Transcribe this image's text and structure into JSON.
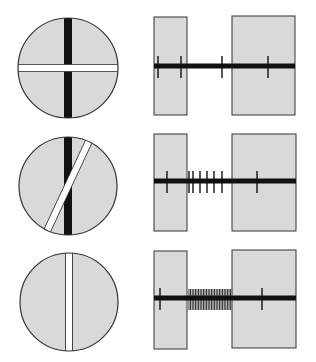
{
  "figure": {
    "colors": {
      "background": "#ffffff",
      "field_fill": "#d9d9d9",
      "outline": "#333333",
      "ink": "#111111",
      "stimulus_bar": "#ffffff"
    },
    "rows": [
      {
        "id": "horizontal",
        "stimulus": {
          "circle": {
            "cx": 68,
            "cy": 68,
            "r": 50
          },
          "bar_angle_deg": 90,
          "label": "bar perpendicular to field axis"
        },
        "recording": {
          "trace_y": 66,
          "left_box": {
            "x": 154,
            "y": 17,
            "w": 33,
            "h": 98
          },
          "right_box": {
            "x": 232,
            "y": 16,
            "w": 63,
            "h": 99
          },
          "spikes_x": [
            158,
            181,
            222,
            268
          ],
          "response": "none"
        }
      },
      {
        "id": "oblique",
        "stimulus": {
          "circle": {
            "cx": 68,
            "cy": 186,
            "r": 49
          },
          "bar_angle_deg": 25,
          "label": "bar oblique to field axis"
        },
        "recording": {
          "trace_y": 181,
          "left_box": {
            "x": 154,
            "y": 134,
            "w": 33,
            "h": 97
          },
          "right_box": {
            "x": 232,
            "y": 134,
            "w": 64,
            "h": 97
          },
          "spikes_x": [
            167,
            189,
            193,
            200,
            207,
            214,
            222,
            257
          ],
          "response": "weak"
        }
      },
      {
        "id": "vertical",
        "stimulus": {
          "circle": {
            "cx": 69,
            "cy": 302,
            "r": 49
          },
          "bar_angle_deg": 0,
          "label": "bar aligned with field axis"
        },
        "recording": {
          "trace_y": 298,
          "left_box": {
            "x": 154,
            "y": 251,
            "w": 33,
            "h": 98
          },
          "right_box": {
            "x": 232,
            "y": 250,
            "w": 64,
            "h": 98
          },
          "spikes_x": [
            160,
            262
          ],
          "burst": {
            "x_start": 189,
            "x_end": 231
          },
          "response": "strong"
        }
      }
    ]
  }
}
